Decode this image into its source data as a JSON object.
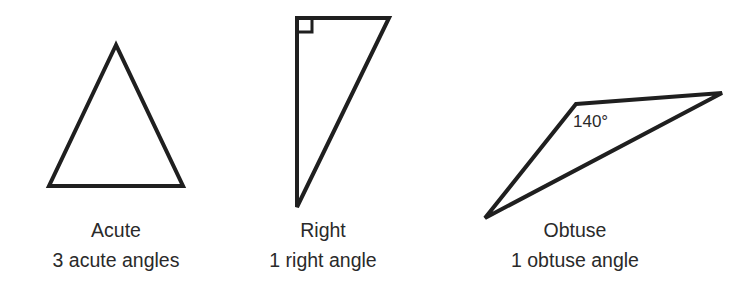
{
  "diagram": {
    "stroke_color": "#1f1f1f",
    "triangles": [
      {
        "id": "acute",
        "name": "Acute",
        "description": "3 acute angles",
        "points": "116,45 49,186 183,186"
      },
      {
        "id": "right",
        "name": "Right",
        "description": "1 right angle",
        "points": "297,18 389,18 297,207",
        "right_angle_marker": "297,32 312,32 312,18"
      },
      {
        "id": "obtuse",
        "name": "Obtuse",
        "description": "1 obtuse angle",
        "points": "576,104 722,93 485,218",
        "angle_label": "140°"
      }
    ]
  }
}
